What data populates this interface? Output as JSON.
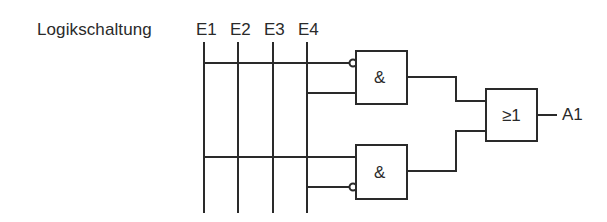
{
  "diagram": {
    "title": "Logikschaltung",
    "inputs": [
      {
        "label": "E1",
        "x": 204
      },
      {
        "label": "E2",
        "x": 238
      },
      {
        "label": "E3",
        "x": 273
      },
      {
        "label": "E4",
        "x": 307
      }
    ],
    "gates": [
      {
        "id": "and-top",
        "symbol": "&",
        "type": "AND",
        "inputs": [
          "NOT E1",
          "E4"
        ]
      },
      {
        "id": "and-bottom",
        "symbol": "&",
        "type": "AND",
        "inputs": [
          "E1",
          "NOT E4"
        ]
      },
      {
        "id": "or",
        "symbol": "≥1",
        "type": "OR",
        "inputs": [
          "and-top",
          "and-bottom"
        ]
      }
    ],
    "output": {
      "label": "A1"
    },
    "colors": {
      "line": "#2a2a2a",
      "background": "#ffffff"
    }
  }
}
